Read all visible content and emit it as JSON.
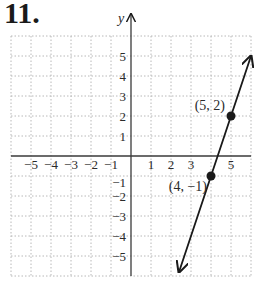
{
  "problem": {
    "number": "11."
  },
  "chart_data": {
    "type": "line",
    "title": "",
    "xlabel": "",
    "ylabel": "y",
    "xlim": [
      -6,
      6
    ],
    "ylim": [
      -6,
      6
    ],
    "grid": true,
    "x_tick_labels": [
      "−5",
      "−4",
      "−3",
      "−2",
      "−1",
      "1",
      "2",
      "3",
      "5"
    ],
    "y_tick_labels": [
      "5",
      "4",
      "3",
      "2",
      "1",
      "−1",
      "−2",
      "−3",
      "−4",
      "−5"
    ],
    "series": [
      {
        "name": "line",
        "equation": "y = 3x − 13",
        "x": [
          4,
          5
        ],
        "y": [
          -1,
          2
        ]
      }
    ],
    "points": [
      {
        "x": 5,
        "y": 2,
        "label": "(5, 2)"
      },
      {
        "x": 4,
        "y": -1,
        "label": "(4, −1)"
      }
    ],
    "colors": {
      "grid": "#b8b8b8",
      "axis": "#3a3a3a",
      "line": "#1a1a1a"
    }
  }
}
